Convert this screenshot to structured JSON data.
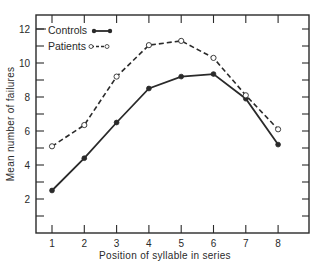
{
  "chart_data": {
    "type": "line",
    "title": "",
    "xlabel": "Position of syllable in series",
    "ylabel": "Mean number of failures",
    "x": [
      1,
      2,
      3,
      4,
      5,
      6,
      7,
      8
    ],
    "xticks": [
      "1",
      "2",
      "3",
      "4",
      "5",
      "6",
      "7",
      "8"
    ],
    "yticks": [
      "2",
      "4",
      "6",
      "8",
      "10",
      "12"
    ],
    "xlim": [
      0.4,
      8.9
    ],
    "ylim": [
      0,
      12.9
    ],
    "grid": false,
    "legend_position": "upper-left",
    "series": [
      {
        "name": "Controls",
        "style": "solid",
        "marker": "filled-circle",
        "values": [
          2.5,
          4.4,
          6.5,
          8.5,
          9.2,
          9.35,
          7.9,
          5.2
        ]
      },
      {
        "name": "Patients",
        "style": "dashed",
        "marker": "open-circle",
        "values": [
          5.1,
          6.35,
          9.2,
          11.05,
          11.3,
          10.3,
          8.1,
          6.1
        ]
      }
    ]
  },
  "colors": {
    "ink": "#2a2a2a",
    "background": "#ffffff"
  }
}
